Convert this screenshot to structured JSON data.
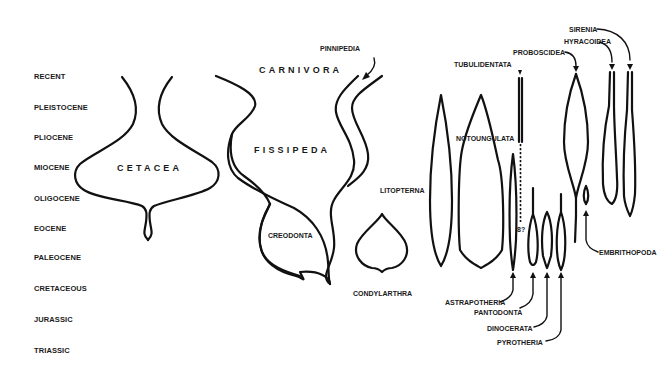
{
  "figure": {
    "type": "phylogenetic spindle diagram",
    "time_scale": {
      "periods": [
        "RECENT",
        "PLEISTOCENE",
        "PLIOCENE",
        "MIOCENE",
        "OLIGOCENE",
        "EOCENE",
        "PALEOCENE",
        "CRETACEOUS",
        "JURASSIC",
        "TRIASSIC"
      ]
    },
    "groups": {
      "cetacea": "CETACEA",
      "carnivora": "CARNIVORA",
      "fissipeda": "FISSIPEDA",
      "pinnipedia": "PINNIPEDIA",
      "creodonta": "CREODONTA",
      "litopterna": "LITOPTERNA",
      "condylarthra": "CONDYLARTHRA",
      "notoungulata": "NOTOUNGULATA",
      "tubulidentata": "TUBULIDENTATA",
      "proboscidea": "PROBOSCIDEA",
      "hyracoidea": "HYRACOIDEA",
      "sirenia": "SIRENIA",
      "embrithopoda": "EMBRITHOPODA",
      "astrapotheria": "ASTRAPOTHERIA",
      "pantodonta": "PANTODONTA",
      "dinocerata": "DINOCERATA",
      "pyrotheria": "PYROTHERIA"
    },
    "uncertain_marker": "8?"
  }
}
